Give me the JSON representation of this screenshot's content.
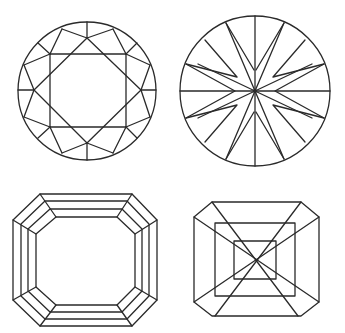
{
  "diagram": {
    "stroke_color": "#2a2a2a",
    "background": "#ffffff",
    "shapes": [
      {
        "name": "round-brilliant-cut",
        "position": "top-left"
      },
      {
        "name": "star-pattern-round-cut",
        "position": "top-right"
      },
      {
        "name": "emerald-cut",
        "position": "bottom-left"
      },
      {
        "name": "asscher-cut",
        "position": "bottom-right"
      }
    ]
  }
}
